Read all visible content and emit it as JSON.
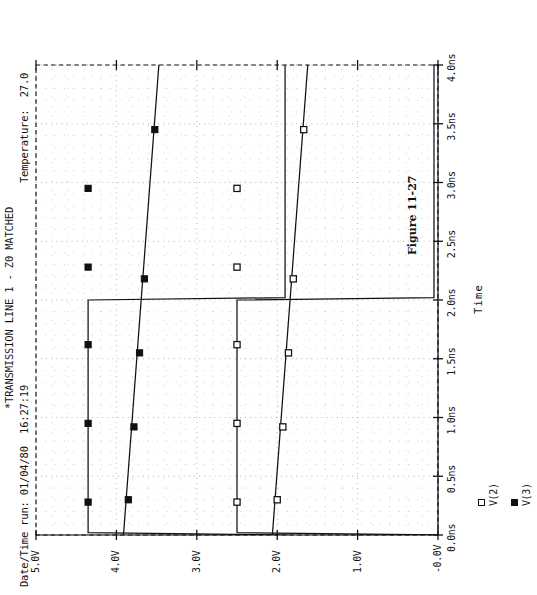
{
  "figure": {
    "caption": "Figure 11-27"
  },
  "header": {
    "date_time_run": "Date/Time run: 01/04/80  16:27:19",
    "title": "*TRANSMISSION LINE 1 - Z0 MATCHED",
    "temperature": "Temperature:  27.0"
  },
  "legend": {
    "items": [
      {
        "marker": "open-square",
        "label": "V(2)"
      },
      {
        "marker": "filled-square",
        "label": "V(3)"
      }
    ]
  },
  "axes": {
    "x": {
      "title": "Time",
      "ticklabels": [
        "0.0ns",
        "0.5ns",
        "1.0ns",
        "1.5ns",
        "2.0ns",
        "2.5ns",
        "3.0ns",
        "3.5ns",
        "4.0ns"
      ],
      "tickvalues": [
        0.0,
        0.5,
        1.0,
        1.5,
        2.0,
        2.5,
        3.0,
        3.5,
        4.0
      ],
      "min": 0.0,
      "max": 4.0,
      "unit": "ns"
    },
    "y": {
      "title": "",
      "ticklabels": [
        "-0.0V",
        "1.0V",
        "2.0V",
        "3.0V",
        "4.0V",
        "5.0V"
      ],
      "tickvalues": [
        0.0,
        1.0,
        2.0,
        3.0,
        4.0,
        5.0
      ],
      "min": 0.0,
      "max": 5.0,
      "unit": "V"
    },
    "grid": "dotted",
    "border": "dashed"
  },
  "colors": {
    "ink": "#131313",
    "trace": "#101010",
    "grid": "#9a9a9a",
    "background": "#ffffff"
  },
  "chart_data": {
    "type": "line",
    "title": "*TRANSMISSION LINE 1 - Z0 MATCHED",
    "subtitle": "Date/Time run: 01/04/80  16:27:19      Temperature:  27.0",
    "xlabel": "Time",
    "ylabel": "",
    "xlim": [
      0.0,
      4.0
    ],
    "ylim": [
      0.0,
      5.0
    ],
    "xtick_labels": [
      "0.0ns",
      "0.5ns",
      "1.0ns",
      "1.5ns",
      "2.0ns",
      "2.5ns",
      "3.0ns",
      "3.5ns",
      "4.0ns"
    ],
    "ytick_labels": [
      "-0.0V",
      "1.0V",
      "2.0V",
      "3.0V",
      "4.0V",
      "5.0V"
    ],
    "grid": true,
    "legend_position": "bottom-left",
    "series": [
      {
        "name": "V(2)",
        "marker": "open-square",
        "x": [
          0.0,
          0.02,
          0.3,
          0.6,
          0.9,
          1.2,
          1.5,
          1.8,
          1.98,
          2.0,
          2.02,
          2.3,
          2.6,
          2.9,
          3.2,
          3.5,
          3.8,
          4.0
        ],
        "y": [
          0.0,
          2.5,
          2.5,
          2.5,
          2.5,
          2.5,
          2.5,
          2.5,
          2.5,
          2.5,
          0.05,
          0.05,
          0.05,
          0.05,
          0.05,
          0.05,
          0.05,
          0.05
        ],
        "marked_points": [
          {
            "x": 0.28,
            "y": 2.5
          },
          {
            "x": 0.95,
            "y": 2.5
          },
          {
            "x": 1.62,
            "y": 2.5
          },
          {
            "x": 2.28,
            "y": 2.5
          },
          {
            "x": 2.95,
            "y": 2.5
          },
          {
            "x": 0.3,
            "y": 0.38
          },
          {
            "x": 0.92,
            "y": 0.3
          },
          {
            "x": 1.55,
            "y": 0.22
          },
          {
            "x": 2.18,
            "y": 0.14
          },
          {
            "x": 3.45,
            "y": 0.0
          }
        ]
      },
      {
        "name": "V(3)",
        "marker": "filled-square",
        "x": [
          0.0,
          0.02,
          0.3,
          0.6,
          0.9,
          1.2,
          1.5,
          1.8,
          1.98,
          2.0,
          2.02,
          2.3,
          2.6,
          2.9,
          3.2,
          3.5,
          3.8,
          4.0
        ],
        "y": [
          0.0,
          2.5,
          2.5,
          2.5,
          2.5,
          2.5,
          2.5,
          2.5,
          2.5,
          2.5,
          0.05,
          0.05,
          0.05,
          0.05,
          0.05,
          0.05,
          0.05,
          0.05
        ],
        "marked_points": [
          {
            "x": 0.28,
            "y": 2.5
          },
          {
            "x": 0.95,
            "y": 2.5
          },
          {
            "x": 1.62,
            "y": 2.5
          },
          {
            "x": 2.28,
            "y": 2.5
          },
          {
            "x": 2.95,
            "y": 2.5
          },
          {
            "x": 0.3,
            "y": 0.38
          },
          {
            "x": 0.92,
            "y": 0.3
          },
          {
            "x": 1.55,
            "y": 0.22
          },
          {
            "x": 2.18,
            "y": 0.14
          },
          {
            "x": 3.45,
            "y": 0.0
          }
        ]
      }
    ]
  }
}
